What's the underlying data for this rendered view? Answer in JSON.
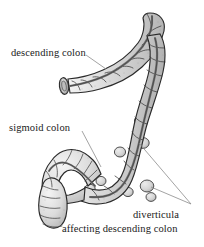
{
  "figure": {
    "kind": "anatomical-illustration",
    "style": "grayscale pen-and-ink line drawing with stipple shading",
    "background_color": "#ffffff",
    "ink_color": "#1a1a1a",
    "bowel_fill_color": "#d9d9d9",
    "bowel_shadow_color": "#b0b0b0",
    "bowel_highlight_color": "#f2f2f2",
    "taenia_color": "#6b6b6b",
    "leader_line_color": "#8c8c8c"
  },
  "labels": {
    "descending_colon": "descending colon",
    "sigmoid_colon": "sigmoid colon",
    "diverticula": "diverticula",
    "affecting": "affecting descending colon"
  },
  "leaders": [
    {
      "name": "descending-colon-leader",
      "from_label": "descending colon",
      "points": "86,55 104,68"
    },
    {
      "name": "sigmoid-colon-leader",
      "from_label": "sigmoid colon",
      "points": "82,131 100,166"
    },
    {
      "name": "diverticula-leader-upper",
      "from_label": "diverticula",
      "points": "192,205 139,143"
    },
    {
      "name": "diverticula-leader-lower",
      "from_label": "diverticula",
      "points": "192,205 150,186"
    }
  ],
  "anatomy": {
    "parts": [
      {
        "name": "descending-colon-upper-limb",
        "note": "tubular segment running from upper right down to the left, closed rounded top end"
      },
      {
        "name": "descending-colon-cut-end",
        "note": "transected elliptical cross-section at the left of the horizontal limb"
      },
      {
        "name": "descending-colon-vertical-limb",
        "note": "long vertical haustrated segment on the right bearing diverticula"
      },
      {
        "name": "sigmoid-colon-loop",
        "note": "S-shaped loop at lower left ending in a blunt rounded tip"
      },
      {
        "name": "taenia-coli-stripe",
        "note": "dark longitudinal muscle band running the length of the bowel"
      },
      {
        "name": "haustra",
        "note": "repeating sacculations along both limbs"
      },
      {
        "name": "diverticula-bulges",
        "note": "small round outpouchings on the right border of the descending colon"
      }
    ]
  }
}
